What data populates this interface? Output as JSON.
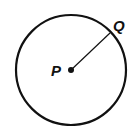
{
  "diagram": {
    "type": "circle-with-radius",
    "center": {
      "label": "P",
      "x": 71,
      "y": 70
    },
    "point_on_circle": {
      "label": "Q",
      "x": 110,
      "y": 33
    },
    "radius_px": 55,
    "colors": {
      "stroke": "#111111",
      "background": "#ffffff"
    }
  }
}
